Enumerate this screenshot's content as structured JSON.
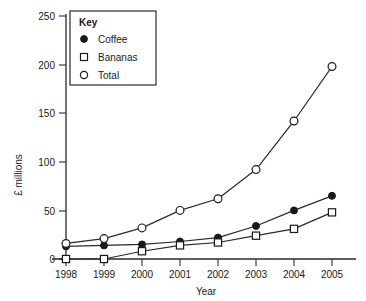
{
  "chart_data": {
    "type": "line",
    "title": "",
    "xlabel": "Year",
    "ylabel": "£ millions",
    "categories": [
      "1998",
      "1999",
      "2000",
      "2001",
      "2002",
      "2003",
      "2004",
      "2005"
    ],
    "x": [
      1998,
      1999,
      2000,
      2001,
      2002,
      2003,
      2004,
      2005
    ],
    "xlim": [
      1998,
      2005
    ],
    "ylim": [
      0,
      250
    ],
    "yticks": [
      0,
      50,
      100,
      150,
      200,
      250
    ],
    "ytick_labels": [
      "0",
      "50",
      "100",
      "150",
      "200",
      "250"
    ],
    "grid": false,
    "legend_position": "top-left",
    "legend_title": "Key",
    "series": [
      {
        "name": "Coffee",
        "marker": "filled-circle",
        "values": [
          13,
          14,
          15,
          18,
          22,
          34,
          50,
          65
        ]
      },
      {
        "name": "Bananas",
        "marker": "open-square",
        "values": [
          0,
          0,
          8,
          14,
          17,
          24,
          31,
          48
        ]
      },
      {
        "name": "Total",
        "marker": "open-circle",
        "values": [
          16,
          21,
          32,
          50,
          62,
          92,
          142,
          198
        ]
      }
    ]
  },
  "legend": {
    "title": "Key",
    "entries": [
      {
        "label": "Coffee",
        "marker": "filled-circle"
      },
      {
        "label": "Bananas",
        "marker": "open-square"
      },
      {
        "label": "Total",
        "marker": "open-circle"
      }
    ]
  },
  "axes": {
    "y_title": "£ millions",
    "x_title": "Year",
    "y_tick_labels": [
      "250",
      "200",
      "150",
      "100",
      "50",
      "0"
    ],
    "x_tick_labels": [
      "1998",
      "1999",
      "2000",
      "2001",
      "2002",
      "2003",
      "2004",
      "2005"
    ]
  },
  "colors": {
    "ink": "#1a1a1a",
    "axis": "#2a2a2a",
    "background": "#ffffff"
  }
}
